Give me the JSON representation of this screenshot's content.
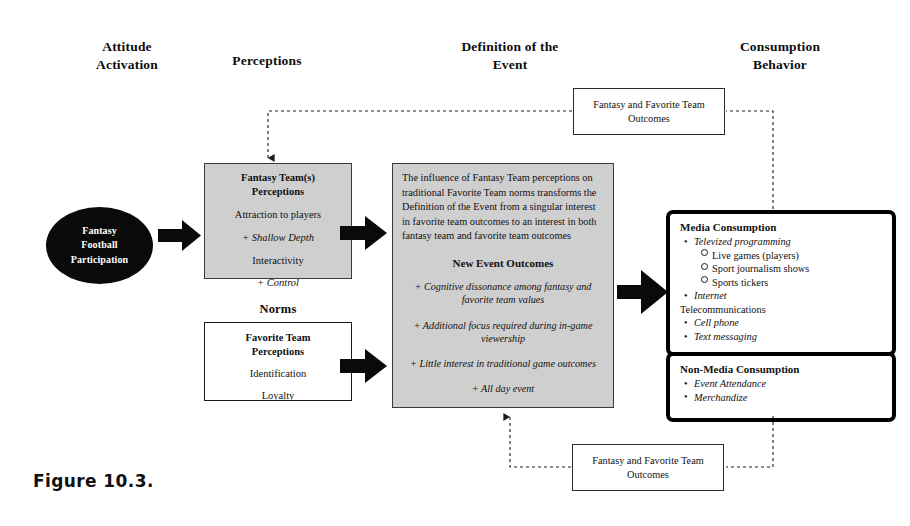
{
  "figure": {
    "caption": "Figure 10.3."
  },
  "headers": [
    {
      "id": "attitude-activation",
      "line1": "Attitude",
      "line2": "Activation"
    },
    {
      "id": "perceptions",
      "line1": "Perceptions",
      "line2": ""
    },
    {
      "id": "definition-of-the-event",
      "line1": "Definition  of the",
      "line2": "Event"
    },
    {
      "id": "consumption-behavior",
      "line1": "Consumption",
      "line2": "Behavior"
    }
  ],
  "source": {
    "line1": "Fantasy",
    "line2": "Football",
    "line3": "Participation"
  },
  "fantasy_perceptions": {
    "title1": "Fantasy Team(s)",
    "title2": "Perceptions",
    "item1": "Attraction to players",
    "item2": "+ Shallow Depth",
    "item3": "Interactivity",
    "item4": "+ Control"
  },
  "norms": {
    "label": "Norms",
    "title1": "Favorite Team",
    "title2": "Perceptions",
    "item1": "Identification",
    "item2": "Loyalty"
  },
  "definition": {
    "paragraph": "The influence of Fantasy Team perceptions on traditional Favorite Team norms transforms the Definition of the Event from a singular interest in favorite team outcomes to an interest in both fantasy team and favorite team outcomes",
    "outcomes_title": "New Event Outcomes",
    "outcomes": [
      "+ Cognitive dissonance among fantasy and favorite team values",
      "+ Additional focus required during in-game viewership",
      "+ Little interest in traditional game outcomes",
      "+ All day event"
    ]
  },
  "media_consumption": {
    "title": "Media Consumption",
    "items": [
      {
        "text": "Televized programming",
        "level": 1,
        "italic": true,
        "marker": "bullet"
      },
      {
        "text": "Live games (players)",
        "level": 2,
        "italic": false,
        "marker": "hollow"
      },
      {
        "text": "Sport journalism  shows",
        "level": 2,
        "italic": false,
        "marker": "hollow"
      },
      {
        "text": "Sports tickers",
        "level": 2,
        "italic": false,
        "marker": "hollow"
      },
      {
        "text": "Internet",
        "level": 1,
        "italic": true,
        "marker": "bullet"
      },
      {
        "text": "Telecommunications",
        "level": 0,
        "italic": false,
        "marker": "none"
      },
      {
        "text": "Cell phone",
        "level": 1,
        "italic": true,
        "marker": "bullet"
      },
      {
        "text": "Text messaging",
        "level": 1,
        "italic": true,
        "marker": "bullet"
      }
    ]
  },
  "non_media_consumption": {
    "title": "Non-Media Consumption",
    "items": [
      {
        "text": "Event Attendance",
        "level": 1,
        "italic": true,
        "marker": "bullet"
      },
      {
        "text": "Merchandize",
        "level": 1,
        "italic": true,
        "marker": "bullet"
      }
    ]
  },
  "feedback_top": {
    "line1": "Fantasy and Favorite Team",
    "line2": "Outcomes"
  },
  "feedback_bottom": {
    "line1": "Fantasy and Favorite Team",
    "line2": "Outcomes"
  },
  "colors": {
    "gray_fill": "#cfcfcf",
    "ink": "#111111",
    "ellipse_fill": "#0a0a0a",
    "page": "#ffffff"
  }
}
